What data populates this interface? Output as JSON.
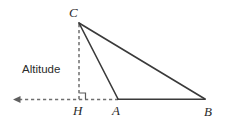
{
  "figure": {
    "background_color": "#ffffff",
    "stroke_color": "#3a3a3a",
    "dash_color": "#6f6f6f",
    "label_color": "#2b2b2b",
    "labels": {
      "apex": "C",
      "foot": "H",
      "base_left": "A",
      "base_right": "B",
      "altitude": "Altitude"
    },
    "points": {
      "C": {
        "x": 79,
        "y": 23
      },
      "H": {
        "x": 79,
        "y": 99
      },
      "A": {
        "x": 118,
        "y": 99
      },
      "B": {
        "x": 205,
        "y": 99
      },
      "ray_end": {
        "x": 14,
        "y": 99
      }
    },
    "label_positions": {
      "C": {
        "x": 69,
        "y": 17
      },
      "H": {
        "x": 73,
        "y": 115
      },
      "A": {
        "x": 112,
        "y": 115
      },
      "B": {
        "x": 204,
        "y": 116
      },
      "altitude": {
        "x": 22,
        "y": 73
      }
    },
    "segments": {
      "CA": "solid",
      "CB": "solid",
      "AB": "solid",
      "CH": "dashed",
      "HA_extension": "dashed",
      "H_to_left_ray": "dashed-with-arrow"
    },
    "right_angle_marker": {
      "at": "H",
      "size": 6,
      "x": 79,
      "y": 99
    }
  }
}
